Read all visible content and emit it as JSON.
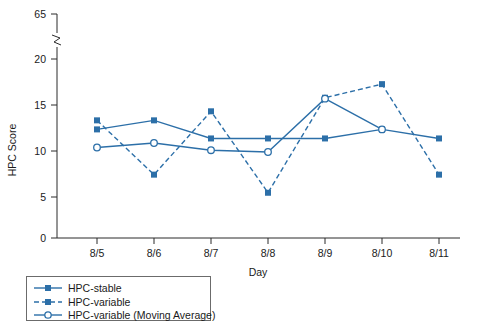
{
  "chart_data": {
    "type": "line",
    "title": "",
    "xlabel": "Day",
    "ylabel": "HPC Score",
    "categories": [
      "8/5",
      "8/6",
      "8/7",
      "8/8",
      "8/9",
      "8/10",
      "8/11"
    ],
    "ytick_labels": [
      "0",
      "5",
      "10",
      "15",
      "20",
      "65"
    ],
    "ytick_values": [
      0,
      5,
      10,
      15,
      20,
      65
    ],
    "ylim": [
      0,
      20
    ],
    "axis_break": true,
    "axis_break_between": [
      20,
      65
    ],
    "grid": false,
    "legend_position": "below-left",
    "accent_color": "#2c6fa8",
    "series": [
      {
        "name": "HPC-stable",
        "style": "solid",
        "marker": "filled-square",
        "values": [
          12,
          13,
          11,
          11,
          11,
          12,
          11
        ]
      },
      {
        "name": "HPC-variable",
        "style": "dashed",
        "marker": "filled-square",
        "values": [
          13,
          7,
          14,
          5,
          15.5,
          17,
          7
        ]
      },
      {
        "name": "HPC-variable (Moving Average)",
        "style": "solid",
        "marker": "open-circle",
        "values": [
          10,
          10.5,
          9.7,
          9.5,
          15.4,
          12,
          null
        ]
      }
    ]
  },
  "legend": {
    "items": [
      {
        "label": "HPC-stable"
      },
      {
        "label": "HPC-variable"
      },
      {
        "label": "HPC-variable (Moving Average)"
      }
    ]
  }
}
